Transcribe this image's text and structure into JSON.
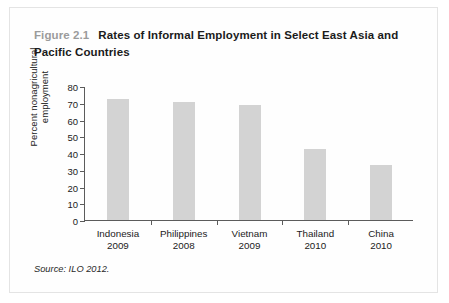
{
  "figure": {
    "number_label": "Figure 2.1",
    "title": "Rates of Informal Employment in Select East Asia and Pacific Countries",
    "source": "Source: ILO 2012."
  },
  "colors": {
    "bar_fill": "#d3d3d3",
    "axis": "#5b5b5b",
    "figure_number": "#9b9b9b",
    "text": "#1b1b1b",
    "panel_border": "#e4e4e4"
  },
  "chart_data": {
    "type": "bar",
    "title": "Rates of Informal Employment in Select East Asia and Pacific Countries",
    "xlabel": "",
    "ylabel": "Percent nonagricultural employment",
    "ylim": [
      0,
      80
    ],
    "yticks": [
      0,
      10,
      20,
      30,
      40,
      50,
      60,
      70,
      80
    ],
    "ytick_labels": [
      "0",
      "10",
      "20",
      "30",
      "40",
      "50",
      "60",
      "70",
      "80"
    ],
    "grid": false,
    "legend": false,
    "categories": [
      "Indonesia\n2009",
      "Philippines\n2008",
      "Vietnam\n2009",
      "Thailand\n2010",
      "China\n2010"
    ],
    "category_names": [
      "Indonesia",
      "Philippines",
      "Vietnam",
      "Thailand",
      "China"
    ],
    "category_years": [
      "2009",
      "2008",
      "2009",
      "2010",
      "2010"
    ],
    "values": [
      72,
      70.5,
      68.5,
      42.5,
      33
    ]
  }
}
